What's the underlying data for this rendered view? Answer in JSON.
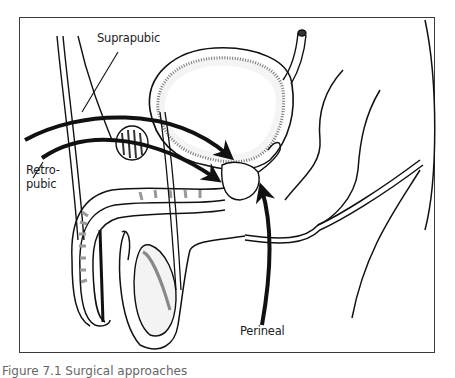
{
  "figure": {
    "labels": {
      "suprapubic": "Suprapubic",
      "retropubic_line1": "Retro-",
      "retropubic_line2": "pubic",
      "perineal": "Perineal"
    },
    "caption_partial": "Figure 7.1  Surgical approaches"
  },
  "colors": {
    "ink": "#111111",
    "frame": "#3a3a3a",
    "shading": "#8a8a8a",
    "background": "#ffffff"
  }
}
